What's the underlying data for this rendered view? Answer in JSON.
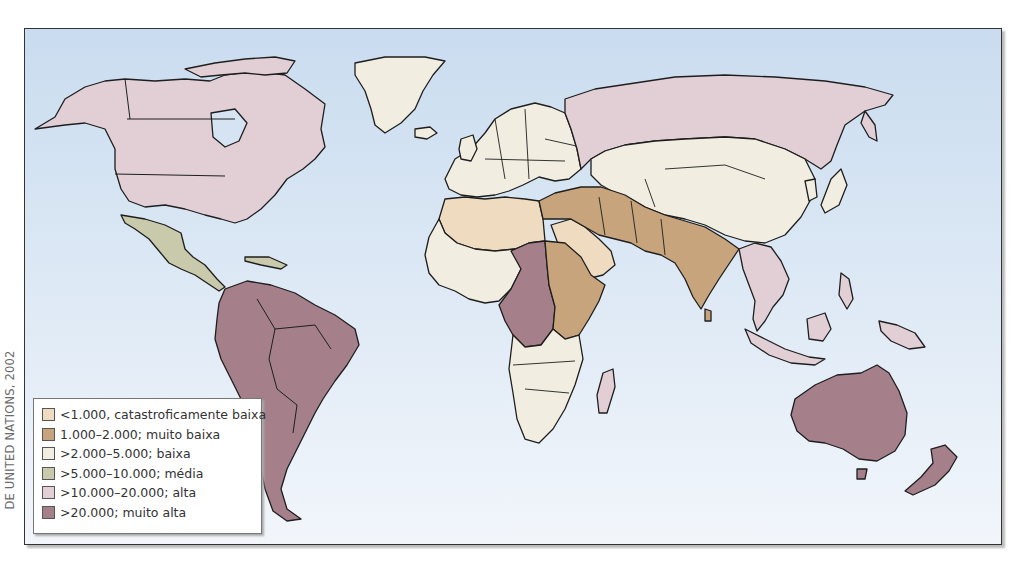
{
  "credit": "DE UNITED NATIONS, 2002",
  "colors": {
    "ocean_top": "#c9dcef",
    "ocean_bottom": "#eef4fb",
    "border": "#1e1e1e"
  },
  "legend": {
    "items": [
      {
        "label": "<1.000, catastroficamente baixa",
        "color": "#efdcc0"
      },
      {
        "label": "1.000–2.000; muito baixa",
        "color": "#c7a47c"
      },
      {
        "label": ">2.000–5.000; baixa",
        "color": "#f1ede0"
      },
      {
        "label": ">5.000–10.000; média",
        "color": "#c9c9ac"
      },
      {
        "label": ">10.000–20.000; alta",
        "color": "#e2cfd6"
      },
      {
        "label": ">20.000; muito alta",
        "color": "#a5808b"
      }
    ]
  },
  "regions": [
    {
      "name": "North America (USA, Canada, Alaska)",
      "class": 4
    },
    {
      "name": "Mexico & Central America",
      "class": 3
    },
    {
      "name": "South America",
      "class": 5
    },
    {
      "name": "Greenland",
      "class": 2
    },
    {
      "name": "Europe",
      "class": 2
    },
    {
      "name": "Russia",
      "class": 4
    },
    {
      "name": "Central Asia & China",
      "class": 2
    },
    {
      "name": "North Africa & Arabia",
      "class": 0
    },
    {
      "name": "Middle East, Iran, Pakistan, India",
      "class": 1
    },
    {
      "name": "Sudan, Ethiopia, East Africa",
      "class": 1
    },
    {
      "name": "Central Africa",
      "class": 5
    },
    {
      "name": "West & Southern Africa",
      "class": 2
    },
    {
      "name": "Madagascar",
      "class": 4
    },
    {
      "name": "Southeast Asia & Indonesia",
      "class": 4
    },
    {
      "name": "Australia",
      "class": 5
    },
    {
      "name": "New Zealand",
      "class": 5
    }
  ]
}
